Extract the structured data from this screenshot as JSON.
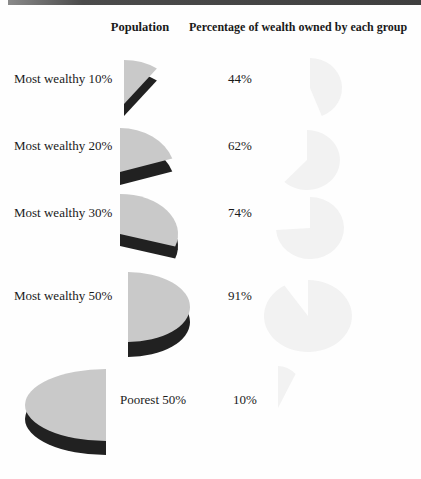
{
  "page": {
    "background": "#fefefe",
    "accent_bar_color": "#4b4b4b"
  },
  "headers": {
    "population": "Population",
    "wealth": "Percentage of wealth owned by each group"
  },
  "colors": {
    "pie_top": "#c9c9c9",
    "pie_side": "#212121",
    "watermark": "#f2f2f2",
    "text": "#1a1a1a"
  },
  "chart_data": {
    "type": "pie",
    "columns": [
      "Population",
      "Percentage of wealth owned by each group"
    ],
    "rows": [
      {
        "group": "Most wealthy 10%",
        "population_pct": 10,
        "wealth_pct": 44,
        "wealth_label": "44%"
      },
      {
        "group": "Most wealthy 20%",
        "population_pct": 20,
        "wealth_pct": 62,
        "wealth_label": "62%"
      },
      {
        "group": "Most wealthy 30%",
        "population_pct": 30,
        "wealth_pct": 74,
        "wealth_label": "74%"
      },
      {
        "group": "Most wealthy 50%",
        "population_pct": 50,
        "wealth_pct": 91,
        "wealth_label": "91%"
      },
      {
        "group": "Poorest 50%",
        "population_pct": 50,
        "wealth_pct": 10,
        "wealth_label": "10%"
      }
    ]
  }
}
